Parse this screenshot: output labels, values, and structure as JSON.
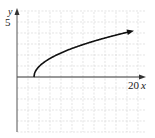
{
  "chart_data": {
    "type": "line",
    "title": "",
    "xlabel": "x",
    "ylabel": "y",
    "x_tick_labels": [
      "20"
    ],
    "y_tick_labels": [
      "5"
    ],
    "xlim": [
      0,
      22
    ],
    "ylim": [
      -5,
      6
    ],
    "grid": true,
    "series": [
      {
        "name": "y = sqrt(x - 3)",
        "x": [
          3,
          4,
          5,
          7,
          9,
          11,
          13,
          15,
          17,
          20
        ],
        "y": [
          0,
          1,
          1.41,
          2,
          2.45,
          2.83,
          3.16,
          3.46,
          3.74,
          4.12
        ],
        "arrow_end": true
      }
    ]
  },
  "labels": {
    "y_axis": "y",
    "x_axis": "x",
    "y_tick": "5",
    "x_tick": "20"
  },
  "colors": {
    "curve": "#111111",
    "axis": "#333333",
    "grid": "#d8d8d8"
  }
}
